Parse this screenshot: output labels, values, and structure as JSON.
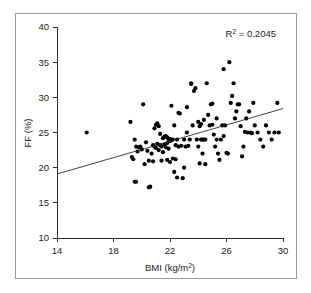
{
  "figure": {
    "border_color": "#9a9a9a",
    "background": "#ffffff"
  },
  "chart_data": {
    "type": "scatter",
    "title": "",
    "xlabel": "BMI (kg/m",
    "xlabel_sup": "2",
    "xlabel_tail": ")",
    "xlabel_full": "BMI (kg/m2)",
    "ylabel": "FF (%)",
    "xlim": [
      14,
      30
    ],
    "ylim": [
      10,
      40
    ],
    "xticks": [
      14,
      18,
      22,
      26,
      30
    ],
    "yticks": [
      10,
      15,
      20,
      25,
      30,
      35,
      40
    ],
    "xtick_labels": [
      "14",
      "18",
      "22",
      "26",
      "30"
    ],
    "ytick_labels": [
      "10",
      "15",
      "20",
      "25",
      "30",
      "35",
      "40"
    ],
    "grid": false,
    "legend": "none",
    "marker": "filled-circle",
    "marker_color": "#000000",
    "marker_size_px": 4.2,
    "annotations": [
      {
        "name": "r-squared",
        "text_prefix": "R",
        "text_sup": "2",
        "text_suffix": " = 0.2045",
        "text_full": "R2 = 0.2045",
        "value": 0.2045,
        "x": 28.2,
        "y": 38.3
      }
    ],
    "trendline": {
      "type": "linear",
      "color": "#2b2b2b",
      "x": [
        14,
        30
      ],
      "y": [
        19.1,
        28.4
      ],
      "slope": 0.581,
      "intercept": 10.96
    },
    "x": [
      16.1,
      19.2,
      19.3,
      19.4,
      19.5,
      19.5,
      19.6,
      19.6,
      19.7,
      19.8,
      19.9,
      20.0,
      20.1,
      20.2,
      20.3,
      20.4,
      20.5,
      20.5,
      20.6,
      20.7,
      20.8,
      20.8,
      20.9,
      20.9,
      21.0,
      21.0,
      21.1,
      21.1,
      21.2,
      21.2,
      21.3,
      21.3,
      21.4,
      21.4,
      21.5,
      21.5,
      21.6,
      21.6,
      21.7,
      21.7,
      21.8,
      21.8,
      21.8,
      21.9,
      21.9,
      22.0,
      22.0,
      22.0,
      22.1,
      22.1,
      22.2,
      22.2,
      22.3,
      22.3,
      22.4,
      22.4,
      22.5,
      22.5,
      22.6,
      22.6,
      22.7,
      22.8,
      22.9,
      23.0,
      23.0,
      23.1,
      23.2,
      23.2,
      23.3,
      23.4,
      23.5,
      23.5,
      23.6,
      23.7,
      23.8,
      23.9,
      24.0,
      24.0,
      24.1,
      24.1,
      24.2,
      24.2,
      24.3,
      24.3,
      24.4,
      24.4,
      24.5,
      24.5,
      24.6,
      24.7,
      24.8,
      24.9,
      25.0,
      25.0,
      25.1,
      25.2,
      25.3,
      25.3,
      25.4,
      25.5,
      25.6,
      25.7,
      25.8,
      25.8,
      25.9,
      26.0,
      26.1,
      26.2,
      26.3,
      26.4,
      26.5,
      26.6,
      26.7,
      26.8,
      26.9,
      27.0,
      27.1,
      27.2,
      27.3,
      27.4,
      27.5,
      27.6,
      27.7,
      27.8,
      27.9,
      28.0,
      28.2,
      28.4,
      28.6,
      28.8,
      29.0,
      29.2,
      29.4,
      29.6,
      29.7
    ],
    "y": [
      25.0,
      26.5,
      21.5,
      21.2,
      24.0,
      18.0,
      18.0,
      23.0,
      22.3,
      22.9,
      23.0,
      22.6,
      29.0,
      20.5,
      23.6,
      22.4,
      17.2,
      21.0,
      17.3,
      22.0,
      23.2,
      20.9,
      23.0,
      25.6,
      26.1,
      22.8,
      23.4,
      26.3,
      22.5,
      25.9,
      23.2,
      24.8,
      23.0,
      21.0,
      24.2,
      22.2,
      24.4,
      23.3,
      24.5,
      22.9,
      24.3,
      23.5,
      21.1,
      24.0,
      22.7,
      24.1,
      23.8,
      20.8,
      28.8,
      23.9,
      24.0,
      21.3,
      26.0,
      19.4,
      23.2,
      21.2,
      24.0,
      18.6,
      27.8,
      23.0,
      27.7,
      23.1,
      18.5,
      24.0,
      20.0,
      23.0,
      25.0,
      28.6,
      23.1,
      24.0,
      31.9,
      32.0,
      26.0,
      30.9,
      31.3,
      24.0,
      26.5,
      23.0,
      25.9,
      20.6,
      26.2,
      24.0,
      24.0,
      22.0,
      24.0,
      26.8,
      24.0,
      20.5,
      32.0,
      27.5,
      26.0,
      29.0,
      29.1,
      26.1,
      24.7,
      23.0,
      27.0,
      24.0,
      22.0,
      21.1,
      24.0,
      26.0,
      34.0,
      24.5,
      26.0,
      22.1,
      22.0,
      35.0,
      29.2,
      30.2,
      32.0,
      27.0,
      28.0,
      29.0,
      29.0,
      25.9,
      21.6,
      23.0,
      25.1,
      27.0,
      25.0,
      28.0,
      25.0,
      24.9,
      29.2,
      26.0,
      25.0,
      24.0,
      23.0,
      26.0,
      25.0,
      24.0,
      25.0,
      29.2,
      25.0
    ]
  }
}
